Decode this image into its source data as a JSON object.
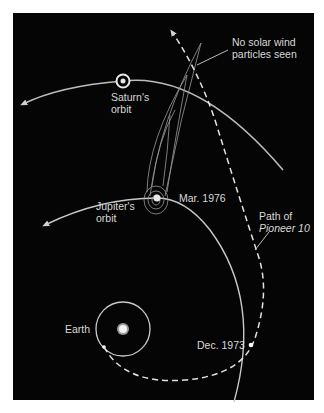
{
  "diagram": {
    "labels": {
      "solar_wind_line1": "No solar wind",
      "solar_wind_line2": "particles seen",
      "saturn_line1": "Saturn's",
      "saturn_line2": "orbit",
      "jupiter_line1": "Jupiter's",
      "jupiter_line2": "orbit",
      "mar_1976": "Mar. 1976",
      "path_line1": "Path of",
      "path_line2": "Pioneer 10",
      "earth": "Earth",
      "dec_1973": "Dec. 1973"
    },
    "colors": {
      "background": "#050505",
      "frame": "#ffffff",
      "lines": "#cfcfcf",
      "text": "#d8d8d8"
    },
    "objects": [
      "sun-icon",
      "earth-orbit",
      "jupiter-orbit",
      "saturn-orbit",
      "saturn-icon",
      "jupiter-magnetosphere-tail",
      "pioneer-10-path"
    ]
  }
}
